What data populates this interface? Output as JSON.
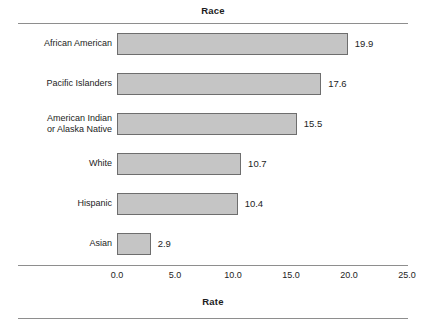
{
  "chart_data": {
    "type": "bar",
    "orientation": "horizontal",
    "title": "Race",
    "xlabel": "Rate",
    "ylabel": "Race",
    "categories": [
      "African American",
      "Pacific Islanders",
      "American Indian\nor Alaska Native",
      "White",
      "Hispanic",
      "Asian"
    ],
    "values": [
      19.9,
      17.6,
      15.5,
      10.7,
      10.4,
      2.9
    ],
    "value_labels": [
      "19.9",
      "17.6",
      "15.5",
      "10.7",
      "10.4",
      "2.9"
    ],
    "xlim": [
      0.0,
      25.0
    ],
    "xticks": [
      0.0,
      5.0,
      10.0,
      15.0,
      20.0,
      25.0
    ],
    "xtick_labels": [
      "0.0",
      "5.0",
      "10.0",
      "15.0",
      "20.0",
      "25.0"
    ],
    "grid": false,
    "legend": null,
    "bar_fill_color": "#c5c5c5",
    "bar_border_color": "#6e6e6e",
    "rule_color": "#8e8e8e",
    "text_color": "#232323",
    "background_color": "#ffffff"
  }
}
